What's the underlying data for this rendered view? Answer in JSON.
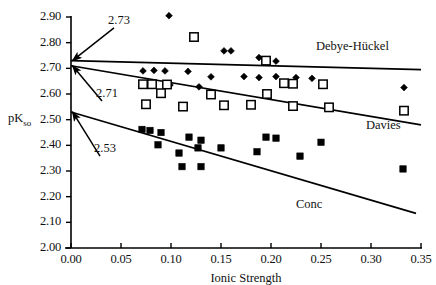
{
  "chart_data": {
    "type": "scatter",
    "title": "",
    "xlabel": "Ionic Strength",
    "ylabel": "pKso",
    "ylabel_base": "pK",
    "ylabel_sub": "so",
    "xlim": [
      0.0,
      0.35
    ],
    "ylim": [
      2.0,
      2.9
    ],
    "xticks": [
      "0.00",
      "0.05",
      "0.10",
      "0.15",
      "0.20",
      "0.25",
      "0.30",
      "0.35"
    ],
    "xtick_values": [
      0.0,
      0.05,
      0.1,
      0.15,
      0.2,
      0.25,
      0.3,
      0.35
    ],
    "yticks": [
      "2.90",
      "2.80",
      "2.70",
      "2.60",
      "2.50",
      "2.40",
      "2.30",
      "2.20",
      "2.10",
      "2.00"
    ],
    "ytick_values": [
      2.9,
      2.8,
      2.7,
      2.6,
      2.5,
      2.4,
      2.3,
      2.2,
      2.1,
      2.0
    ],
    "grid": false,
    "legend_position": "inline-annotations",
    "series": [
      {
        "name": "Debye-Hückel",
        "marker": "filled-diamond",
        "color": "#000000",
        "points": [
          [
            0.098,
            2.905
          ],
          [
            0.123,
            2.82
          ],
          [
            0.153,
            2.768
          ],
          [
            0.16,
            2.768
          ],
          [
            0.188,
            2.742
          ],
          [
            0.205,
            2.728
          ],
          [
            0.072,
            2.69
          ],
          [
            0.083,
            2.692
          ],
          [
            0.094,
            2.69
          ],
          [
            0.117,
            2.688
          ],
          [
            0.14,
            2.667
          ],
          [
            0.173,
            2.668
          ],
          [
            0.188,
            2.664
          ],
          [
            0.205,
            2.668
          ],
          [
            0.225,
            2.664
          ],
          [
            0.241,
            2.661
          ],
          [
            0.099,
            2.635
          ],
          [
            0.128,
            2.628
          ],
          [
            0.333,
            2.625
          ]
        ],
        "fit_line": {
          "x0": 0.0,
          "y0": 2.73,
          "x1": 0.35,
          "y1": 2.695
        }
      },
      {
        "name": "Davies",
        "marker": "open-square",
        "color": "#000000",
        "points": [
          [
            0.123,
            2.822
          ],
          [
            0.195,
            2.73
          ],
          [
            0.072,
            2.638
          ],
          [
            0.081,
            2.638
          ],
          [
            0.096,
            2.637
          ],
          [
            0.213,
            2.642
          ],
          [
            0.222,
            2.64
          ],
          [
            0.252,
            2.638
          ],
          [
            0.09,
            2.603
          ],
          [
            0.14,
            2.598
          ],
          [
            0.196,
            2.6
          ],
          [
            0.075,
            2.56
          ],
          [
            0.112,
            2.551
          ],
          [
            0.153,
            2.556
          ],
          [
            0.18,
            2.558
          ],
          [
            0.222,
            2.553
          ],
          [
            0.258,
            2.548
          ],
          [
            0.333,
            2.535
          ]
        ],
        "fit_line": {
          "x0": 0.0,
          "y0": 2.71,
          "x1": 0.35,
          "y1": 2.48
        }
      },
      {
        "name": "Conc",
        "marker": "filled-square",
        "color": "#000000",
        "points": [
          [
            0.108,
            2.37
          ],
          [
            0.13,
            2.42
          ],
          [
            0.25,
            2.412
          ],
          [
            0.071,
            2.462
          ],
          [
            0.079,
            2.458
          ],
          [
            0.09,
            2.45
          ],
          [
            0.118,
            2.432
          ],
          [
            0.195,
            2.432
          ],
          [
            0.205,
            2.428
          ],
          [
            0.087,
            2.402
          ],
          [
            0.127,
            2.39
          ],
          [
            0.15,
            2.39
          ],
          [
            0.186,
            2.375
          ],
          [
            0.111,
            2.317
          ],
          [
            0.13,
            2.317
          ],
          [
            0.229,
            2.358
          ],
          [
            0.332,
            2.308
          ]
        ],
        "fit_line": {
          "x0": 0.0,
          "y0": 2.53,
          "x1": 0.345,
          "y1": 2.135
        }
      }
    ],
    "annotations": [
      {
        "label": "2.73",
        "target_x": 0.0,
        "target_y": 2.73,
        "text_x": 0.037,
        "text_y": 2.885
      },
      {
        "label": "2.71",
        "target_x": 0.0,
        "target_y": 2.71,
        "text_x": 0.025,
        "text_y": 2.6
      },
      {
        "label": "2.53",
        "target_x": 0.0,
        "target_y": 2.53,
        "text_x": 0.023,
        "text_y": 2.385
      }
    ],
    "series_labels": [
      {
        "text": "Debye-Hückel",
        "x": 0.245,
        "y": 2.778
      },
      {
        "text": "Davies",
        "x": 0.295,
        "y": 2.472
      },
      {
        "text": "Conc",
        "x": 0.225,
        "y": 2.165
      }
    ]
  }
}
